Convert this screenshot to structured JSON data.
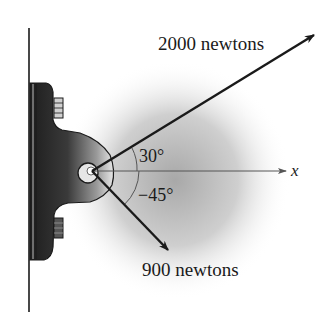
{
  "diagram": {
    "forces": [
      {
        "label": "2000 newtons",
        "magnitude": 2000,
        "unit": "newtons",
        "angle_deg": 30
      },
      {
        "label": "900 newtons",
        "magnitude": 900,
        "unit": "newtons",
        "angle_deg": -45
      }
    ],
    "angle_labels": {
      "upper": "30°",
      "lower": "−45°"
    },
    "axis_label": "x",
    "colors": {
      "ink": "#1a1a1a",
      "glow": "#b8b8b8"
    }
  }
}
